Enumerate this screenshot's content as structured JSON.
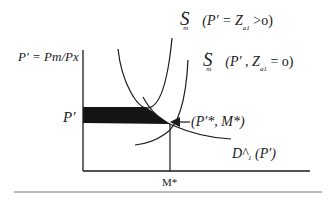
{
  "diagram": {
    "title": "",
    "y_axis_label": "P′ = Pm/Px",
    "x_axis_tick": "M*",
    "y_axis_tick": "P′",
    "curves": [
      {
        "id": "supply-positive-tariff",
        "symbol": "S",
        "superscript": "′",
        "subscript": "m",
        "condition": "(P′ = Z",
        "condition_sub": "a1",
        "condition_tail": " >o)"
      },
      {
        "id": "supply-zero-tariff",
        "symbol": "S",
        "superscript": "′",
        "subscript": "m",
        "condition": "(P′ , Z",
        "condition_sub": "a1",
        "condition_tail": " = o)"
      },
      {
        "id": "demand",
        "label": "D^",
        "label_sub": "1",
        "label_tail": " (P′)"
      }
    ],
    "equilibrium_label": "(P′*, M*)",
    "colors": {
      "line": "#1a1a1a",
      "fill": "#141414",
      "background": "#ffffff"
    }
  }
}
